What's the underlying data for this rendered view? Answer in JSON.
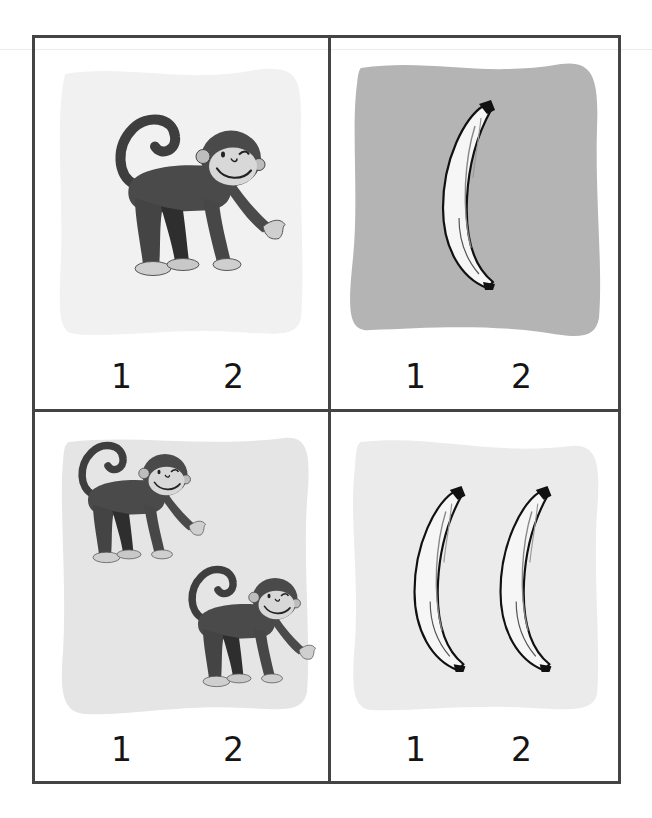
{
  "worksheet": {
    "title": "",
    "cards": [
      {
        "id": "card-1",
        "subject": "monkey",
        "count": 1,
        "background_color": "#f1f1f1",
        "options": [
          "1",
          "2"
        ]
      },
      {
        "id": "card-2",
        "subject": "banana",
        "count": 1,
        "background_color": "#b4b4b4",
        "options": [
          "1",
          "2"
        ]
      },
      {
        "id": "card-3",
        "subject": "monkey",
        "count": 2,
        "background_color": "#e5e5e5",
        "options": [
          "1",
          "2"
        ]
      },
      {
        "id": "card-4",
        "subject": "banana",
        "count": 2,
        "background_color": "#ebebeb",
        "options": [
          "1",
          "2"
        ]
      }
    ],
    "colors": {
      "frame": "#444444",
      "number_text": "#151515",
      "monkey_fur": "#4a4a4a",
      "monkey_face": "#d8d8d8",
      "banana_fill": "#f4f4f4",
      "banana_outline": "#111111"
    }
  }
}
